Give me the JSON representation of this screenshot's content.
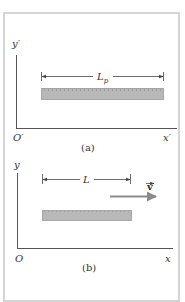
{
  "figure": {
    "panel_a": {
      "caption": "(a)",
      "y_axis_label": "y′",
      "origin_label": "O′",
      "x_axis_label": "x′",
      "length_label_main": "L",
      "length_label_sub": "p",
      "object": "ruler (at rest)"
    },
    "panel_b": {
      "caption": "(b)",
      "y_axis_label": "y",
      "origin_label": "O",
      "x_axis_label": "x",
      "length_label": "L",
      "velocity_label": "v",
      "object": "ruler (moving)"
    },
    "colors": {
      "frame_border": "#d4d4d4",
      "axis": "#555555",
      "ruler_fill": "#b8b8b8",
      "ruler_border": "#9a9a9a",
      "velocity_arrow": "#8a8a8a",
      "text": "#333333"
    }
  }
}
